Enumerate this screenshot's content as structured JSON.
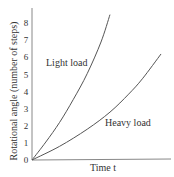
{
  "chart_data": {
    "type": "line",
    "title": "",
    "xlabel": "Time t",
    "ylabel": "Rotational angle (number of steps)",
    "y_ticks": [
      "0",
      "1",
      "2",
      "3",
      "4",
      "5",
      "6",
      "7",
      "8"
    ],
    "x_ticks": [],
    "ylim": [
      0,
      8.5
    ],
    "xlim": [
      0,
      10
    ],
    "grid": false,
    "legend": "inline labels",
    "series": [
      {
        "name": "Light load",
        "x": [
          0,
          1,
          2,
          3,
          4,
          5,
          5.65
        ],
        "y": [
          0,
          1.05,
          2.2,
          3.55,
          5.05,
          6.9,
          8.5
        ]
      },
      {
        "name": "Heavy load",
        "x": [
          0,
          2,
          4,
          5.65,
          7,
          8,
          9.35
        ],
        "y": [
          0,
          0.8,
          1.8,
          2.8,
          3.85,
          4.75,
          6.2
        ]
      }
    ],
    "annotations": [
      {
        "text": "Light load",
        "near_series": "Light load"
      },
      {
        "text": "Heavy load",
        "near_series": "Heavy load"
      }
    ]
  }
}
